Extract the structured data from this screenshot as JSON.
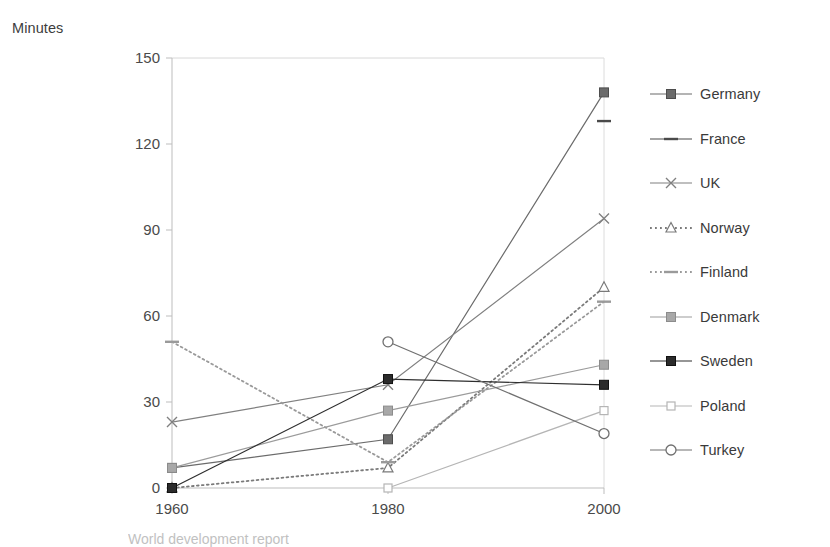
{
  "axis": {
    "y_title": "Minutes",
    "y_ticks": [
      "0",
      "30",
      "60",
      "90",
      "120",
      "150"
    ],
    "x_ticks": [
      "1960",
      "1980",
      "2000"
    ]
  },
  "legend": {
    "items": [
      {
        "label": "Germany",
        "marker": "filled-square-icon",
        "line": "solid",
        "color": "#6b6b6b"
      },
      {
        "label": "France",
        "marker": "dash-icon",
        "line": "solid",
        "color": "#4a4a4a"
      },
      {
        "label": "UK",
        "marker": "x-cross-icon",
        "line": "solid",
        "color": "#808080"
      },
      {
        "label": "Norway",
        "marker": "open-triangle-icon",
        "line": "dotted",
        "color": "#7a7a7a"
      },
      {
        "label": "Finland",
        "marker": "dash-icon",
        "line": "dotted",
        "color": "#9a9a9a"
      },
      {
        "label": "Denmark",
        "marker": "grey-square-icon",
        "line": "solid",
        "color": "#9b9b9b"
      },
      {
        "label": "Sweden",
        "marker": "black-square-icon",
        "line": "solid",
        "color": "#2e2e2e"
      },
      {
        "label": "Poland",
        "marker": "open-square-icon",
        "line": "solid",
        "color": "#b5b5b5"
      },
      {
        "label": "Turkey",
        "marker": "open-circle-icon",
        "line": "solid",
        "color": "#707070"
      }
    ]
  },
  "caption": "World development report",
  "chart_data": {
    "type": "line",
    "title": "",
    "xlabel": "",
    "ylabel": "Minutes",
    "categories": [
      "1960",
      "1980",
      "2000"
    ],
    "ylim": [
      0,
      150
    ],
    "ytick_step": 30,
    "grid": false,
    "legend_position": "right",
    "series": [
      {
        "name": "Germany",
        "values": [
          7,
          17,
          138
        ],
        "marker": "filled-square",
        "line": "solid",
        "color": "#6b6b6b"
      },
      {
        "name": "France",
        "values": [
          null,
          null,
          128
        ],
        "marker": "dash",
        "line": "solid",
        "color": "#4a4a4a"
      },
      {
        "name": "UK",
        "values": [
          23,
          36,
          94
        ],
        "marker": "x-cross",
        "line": "solid",
        "color": "#808080"
      },
      {
        "name": "Norway",
        "values": [
          0,
          7,
          70
        ],
        "marker": "open-triangle",
        "line": "dotted",
        "color": "#7a7a7a"
      },
      {
        "name": "Finland",
        "values": [
          51,
          9,
          65
        ],
        "marker": "dash",
        "line": "dotted",
        "color": "#9a9a9a"
      },
      {
        "name": "Denmark",
        "values": [
          7,
          27,
          43
        ],
        "marker": "grey-square",
        "line": "solid",
        "color": "#9b9b9b"
      },
      {
        "name": "Sweden",
        "values": [
          0,
          38,
          36
        ],
        "marker": "black-square",
        "line": "solid",
        "color": "#2e2e2e"
      },
      {
        "name": "Poland",
        "values": [
          null,
          0,
          27
        ],
        "marker": "open-square",
        "line": "solid",
        "color": "#b5b5b5"
      },
      {
        "name": "Turkey",
        "values": [
          null,
          51,
          19
        ],
        "marker": "open-circle",
        "line": "solid",
        "color": "#707070"
      }
    ]
  }
}
